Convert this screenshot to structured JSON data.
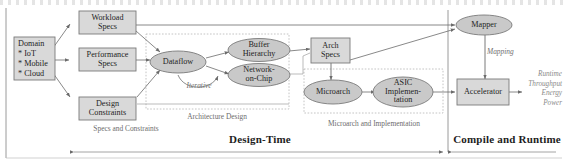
{
  "figure": {
    "type": "flow-diagram",
    "title": "",
    "phases": [
      {
        "name": "design-time",
        "label": "Design-Time"
      },
      {
        "name": "compile-runtime",
        "label": "Compile and Runtime"
      }
    ],
    "group_labels": [
      {
        "name": "specs-and-constraints",
        "label": "Specs and Constraints"
      },
      {
        "name": "architecture-design",
        "label": "Architecture Design"
      },
      {
        "name": "microarch-and-implementation",
        "label": "Microarch and Implementation"
      }
    ],
    "edge_labels": [
      {
        "name": "iterative",
        "label": "Iterative"
      },
      {
        "name": "mapping",
        "label": "Mapping"
      }
    ],
    "domain_box": {
      "title": "Domain",
      "items": [
        "* IoT",
        "* Mobile",
        "* Cloud"
      ]
    },
    "boxes": [
      {
        "name": "workload-specs",
        "lines": [
          "Workload",
          "Specs"
        ]
      },
      {
        "name": "performance-specs",
        "lines": [
          "Performance",
          "Specs"
        ]
      },
      {
        "name": "design-constraints",
        "lines": [
          "Design",
          "Constraints"
        ]
      },
      {
        "name": "arch-specs",
        "lines": [
          "Arch",
          "Specs"
        ]
      },
      {
        "name": "accelerator",
        "lines": [
          "Accelerator"
        ]
      }
    ],
    "ellipses": [
      {
        "name": "dataflow",
        "lines": [
          "Dataflow"
        ]
      },
      {
        "name": "buffer-hierarchy",
        "lines": [
          "Buffer",
          "Hierarchy"
        ]
      },
      {
        "name": "network-on-chip",
        "lines": [
          "Network-",
          "on-Chip"
        ]
      },
      {
        "name": "microarch",
        "lines": [
          "Microarch"
        ]
      },
      {
        "name": "asic-implementation",
        "lines": [
          "ASIC",
          "Implemen-",
          "tation"
        ]
      },
      {
        "name": "mapper",
        "lines": [
          "Mapper"
        ]
      }
    ],
    "outputs": {
      "name": "runtime-metrics",
      "items": [
        "Runtime",
        "Throughput",
        "Energy",
        "Power"
      ]
    },
    "colors": {
      "box_fill": "#d9d9d9",
      "ellipse_fill": "#c9c9c9",
      "stroke": "#7a7a7a",
      "group_border": "#b9b9b9",
      "text": "#242424",
      "muted_text": "#6d6d6d"
    }
  }
}
